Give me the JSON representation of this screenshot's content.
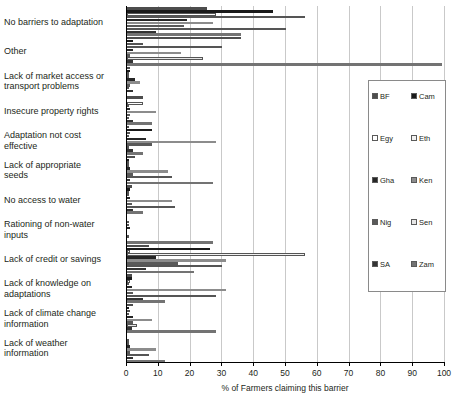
{
  "chart_data": {
    "type": "bar",
    "orientation": "horizontal",
    "title": "",
    "xlabel": "% of Farmers claiming this barrier",
    "ylabel": "",
    "xlim": [
      0,
      100
    ],
    "xticks": [
      0,
      10,
      20,
      30,
      40,
      50,
      60,
      70,
      80,
      90,
      100
    ],
    "grid": true,
    "legend_position": "right",
    "categories": [
      "No barriers to adaptation",
      "Other",
      "Lack of market access or\ntransport problems",
      "Insecure property rights",
      "Adaptation not cost\neffective",
      "Lack of appropriate\nseeds",
      "No access to water",
      "Rationing of non-water\ninputs",
      "Lack of credit or savings",
      "Lack of knowledge on\nadaptations",
      "Lack of climate change\ninformation",
      "Lack of weather\ninformation"
    ],
    "series": [
      {
        "name": "BF",
        "color": "#4d4d4d",
        "values": [
          25,
          36,
          0.8,
          5,
          0.5,
          2.5,
          1.5,
          0,
          7,
          1.5,
          2,
          0
        ]
      },
      {
        "name": "Cam",
        "color": "#1a1a1a",
        "values": [
          46,
          2,
          1,
          0,
          8,
          0.5,
          1,
          0,
          26,
          1.5,
          0.5,
          0
        ]
      },
      {
        "name": "Egy",
        "color": "#ffffff",
        "values": [
          28,
          5,
          0,
          5,
          1,
          0,
          0,
          0,
          1,
          1,
          1,
          0
        ]
      },
      {
        "name": "Eth",
        "color": "#f2f2f2",
        "values": [
          56,
          30,
          0,
          0,
          0,
          0,
          0,
          0,
          56,
          0,
          0,
          0
        ]
      },
      {
        "name": "Gha",
        "color": "#262626",
        "values": [
          19,
          2,
          2.5,
          1,
          6,
          1,
          1,
          1,
          9,
          1.5,
          2,
          1
        ]
      },
      {
        "name": "Ken",
        "color": "#8c8c8c",
        "values": [
          27,
          17,
          4,
          9,
          28,
          13,
          14,
          0,
          31,
          31,
          8,
          9
        ]
      },
      {
        "name": "Nig",
        "color": "#595959",
        "values": [
          18,
          1,
          1,
          1,
          8,
          2,
          1.5,
          0,
          16,
          2,
          2,
          1
        ]
      },
      {
        "name": "Sen",
        "color": "#e6e6e6",
        "values": [
          50,
          24,
          0,
          0,
          0,
          14,
          15,
          0,
          30,
          28,
          3,
          7
        ]
      },
      {
        "name": "SA",
        "color": "#333333",
        "values": [
          9,
          2,
          2,
          2,
          2,
          1,
          2,
          0,
          6,
          5,
          1.5,
          2
        ]
      },
      {
        "name": "Zam",
        "color": "#737373",
        "values": [
          36,
          99,
          0,
          8,
          5,
          27,
          5,
          27,
          21,
          12,
          28,
          12
        ]
      }
    ]
  },
  "legend": {
    "entries": [
      {
        "label": "BF",
        "color": "#4d4d4d"
      },
      {
        "label": "Cam",
        "color": "#1a1a1a"
      },
      {
        "label": "Egy",
        "color": "#ffffff"
      },
      {
        "label": "Eth",
        "color": "#f2f2f2"
      },
      {
        "label": "Gha",
        "color": "#262626"
      },
      {
        "label": "Ken",
        "color": "#8c8c8c"
      },
      {
        "label": "Nig",
        "color": "#595959"
      },
      {
        "label": "Sen",
        "color": "#e6e6e6"
      },
      {
        "label": "SA",
        "color": "#333333"
      },
      {
        "label": "Zam",
        "color": "#737373"
      }
    ]
  },
  "colors": {
    "axis": "#000000",
    "grid": "#c9c9c9",
    "text": "#231f20",
    "background": "#ffffff"
  }
}
